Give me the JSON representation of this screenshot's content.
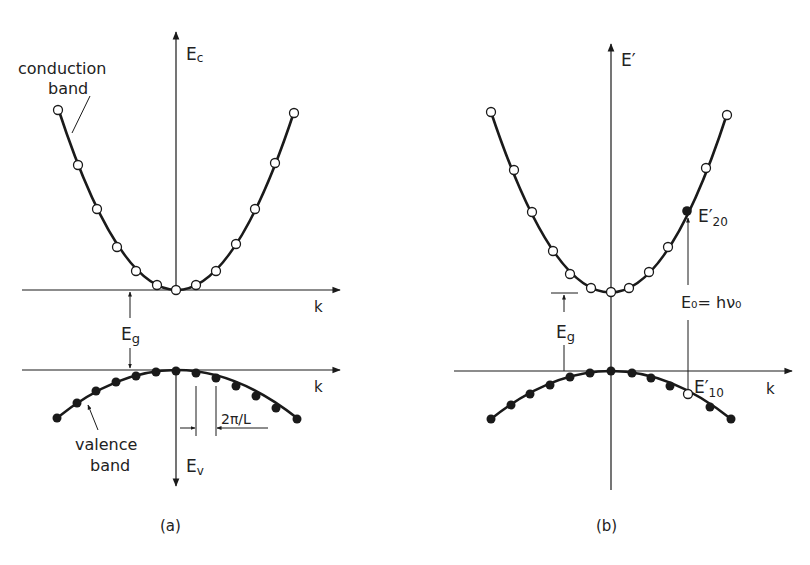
{
  "figure": {
    "panel_a": {
      "caption": "(a)",
      "conduction_axis_label": "E",
      "conduction_axis_sub": "c",
      "valence_axis_label": "E",
      "valence_axis_sub": "v",
      "k_label_upper": "k",
      "k_label_lower": "k",
      "conduction_band_label_1": "conduction",
      "conduction_band_label_2": "band",
      "valence_band_label_1": "valence",
      "valence_band_label_2": "band",
      "gap_label": "E",
      "gap_sub": "g",
      "spacing_label": "2π/L"
    },
    "panel_b": {
      "caption": "(b)",
      "axis_label": "E′",
      "k_label": "k",
      "gap_label": "E",
      "gap_sub": "g",
      "transition_label": "E₀= hν₀",
      "upper_state_label": "E′",
      "upper_state_sub": "20",
      "lower_state_label": "E′",
      "lower_state_sub": "10"
    },
    "colors": {
      "line": "#1a1a1a",
      "open_marker_fill": "#ffffff",
      "filled_marker_fill": "#1a1a1a"
    }
  }
}
